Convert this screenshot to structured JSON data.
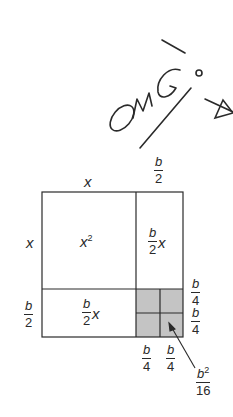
{
  "annotation": {
    "handwritten_text": "OMG!",
    "extra_mark": "star-doodle"
  },
  "diagram": {
    "top_labels": {
      "left": "x",
      "right_num": "b",
      "right_den": "2"
    },
    "side_labels": {
      "top": "x",
      "bottom_num": "b",
      "bottom_den": "2"
    },
    "regions": {
      "big_square": {
        "base": "x",
        "exp": "2"
      },
      "right_rect": {
        "num": "b",
        "den": "2",
        "var": "x"
      },
      "bottom_rect": {
        "num": "b",
        "den": "2",
        "var": "x"
      },
      "corner": {
        "shaded": true,
        "subdivisions": 4,
        "fill": "#c4c4c4"
      }
    },
    "corner_right_labels": [
      {
        "num": "b",
        "den": "4"
      },
      {
        "num": "b",
        "den": "4"
      }
    ],
    "corner_bottom_labels": [
      {
        "num": "b",
        "den": "4"
      },
      {
        "num": "b",
        "den": "4"
      }
    ],
    "callout": {
      "num_base": "b",
      "num_exp": "2",
      "den": "16"
    },
    "colors": {
      "stroke": "#2a2a2a",
      "shade": "#c4c4c4"
    }
  }
}
